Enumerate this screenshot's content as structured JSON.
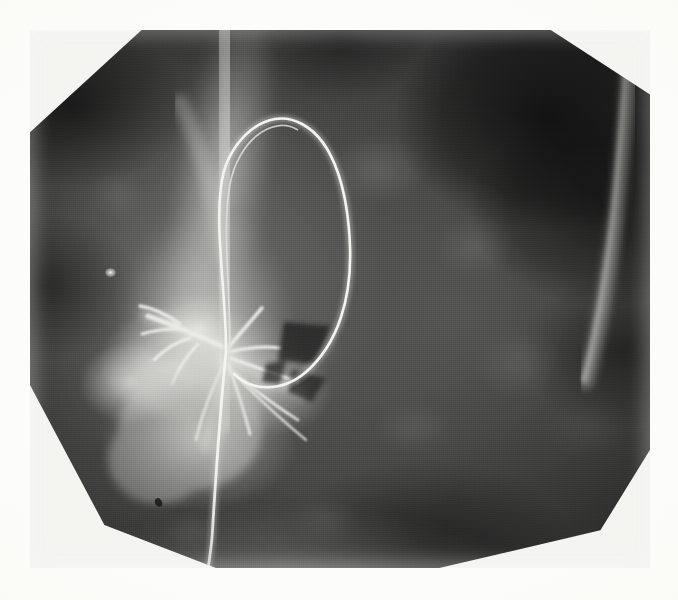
{
  "image": {
    "kind": "medical-radiograph",
    "modality": "X-ray / fluoroscopic spot film",
    "body_region": "chest",
    "view": "frontal",
    "colorspace": "grayscale",
    "presentation": "halftone-printed scan on white page",
    "width_px": 678,
    "height_px": 600,
    "caption": "",
    "label": "",
    "annotations": []
  },
  "page": {
    "background_color": "#fdfdfb",
    "margin_left_px": 30,
    "margin_top_px": 30,
    "margin_right_px": 28,
    "margin_bottom_px": 32
  },
  "plate": {
    "left_px": 30,
    "top_px": 30,
    "width_px": 620,
    "height_px": 538,
    "field_shape": "octagonal-collimated",
    "corner_cuts": [
      "top-left",
      "top-right",
      "bottom-left",
      "bottom-right"
    ],
    "background_color": "#2a2a2a",
    "highlight_color": "#f2f2ee",
    "midtone_color": "#6e6e6c",
    "shadow_color": "#141414"
  },
  "features": [
    {
      "name": "catheter-loop",
      "description": "thin radiopaque catheter forming a tall loop in the upper mid-field",
      "apex_px": [
        250,
        112
      ],
      "color": "#eeeeea"
    },
    {
      "name": "catheter-shaft",
      "description": "catheter descending vertically out of the lower edge of the field",
      "exit_px": [
        215,
        568
      ],
      "color": "#eeeeea"
    },
    {
      "name": "hilar-contrast-blush",
      "description": "bright branching contrast-filled structures at the left hilum",
      "center_px": [
        190,
        330
      ],
      "color": "#f4f4f0"
    },
    {
      "name": "mediastinal-band",
      "description": "bright vertical mediastinal / vertebral band",
      "center_px": [
        215,
        220
      ],
      "color": "#d6d6d2"
    },
    {
      "name": "lucent-lung-zone",
      "description": "dark aerated lung region in the upper right field",
      "center_px": [
        520,
        150
      ],
      "color": "#101010"
    },
    {
      "name": "diaphragm-shadow",
      "description": "bright diaphragmatic / subdiaphragmatic shadow along the lower border",
      "center_px": [
        330,
        540
      ],
      "color": "#dedeD9"
    },
    {
      "name": "calcific-density",
      "description": "small punctate bright density in the left lung field",
      "center_px": [
        110,
        272
      ],
      "color": "#f6f6f2"
    },
    {
      "name": "print-artifact-speck",
      "description": "small dark speck artifact near the lower-left border",
      "center_px": [
        158,
        502
      ],
      "color": "#262522"
    },
    {
      "name": "chest-wall-edge",
      "description": "bright curved soft-tissue / rib edge along the right upper border",
      "center_px": [
        615,
        140
      ],
      "color": "#b4b4b0"
    }
  ]
}
